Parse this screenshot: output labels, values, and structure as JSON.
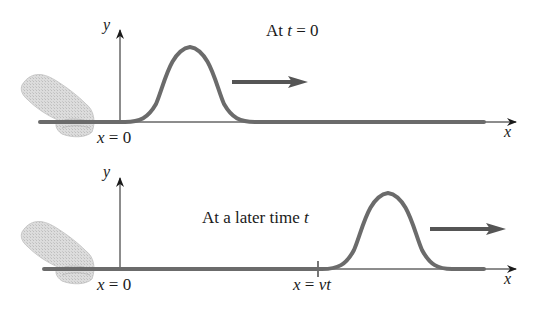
{
  "panels": [
    {
      "id": "initial",
      "caption": "At t = 0",
      "caption_parts": {
        "prefix": "At ",
        "var": "t",
        "suffix": " = 0"
      },
      "y_axis_label": "y",
      "x_axis_label": "x",
      "origin_label": {
        "var": "x",
        "eq": " = 0"
      },
      "pulse_center_x": 190,
      "motion_arrow": "right"
    },
    {
      "id": "later",
      "caption": "At a later time t",
      "caption_parts": {
        "prefix": "At a later time ",
        "var": "t",
        "suffix": ""
      },
      "y_axis_label": "y",
      "x_axis_label": "x",
      "origin_label": {
        "var": "x",
        "eq": " = 0"
      },
      "position_label": {
        "var": "x",
        "eq": " = ",
        "expr": "vt"
      },
      "pulse_center_x": 388,
      "motion_arrow": "right"
    }
  ],
  "colors": {
    "rope": "#6b6b6b",
    "axis": "#1a1a1a",
    "arrow": "#555555",
    "hand": "#d6d6d6"
  }
}
